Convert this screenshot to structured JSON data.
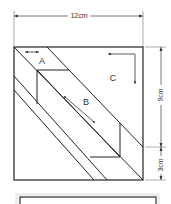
{
  "diagram": {
    "type": "quilt-block-cutting-diagram",
    "dimensions": {
      "width_label": "12cm",
      "height_upper_label": "9cm",
      "height_lower_label": "3cm"
    },
    "pieces": [
      {
        "id": "A",
        "label": "A"
      },
      {
        "id": "B",
        "label": "B"
      },
      {
        "id": "C",
        "label": "C"
      }
    ],
    "colors": {
      "line": "#222222",
      "dimension_line": "#555555",
      "text": "#333333",
      "bottom_frame_fill": "#f4f4f4"
    }
  }
}
